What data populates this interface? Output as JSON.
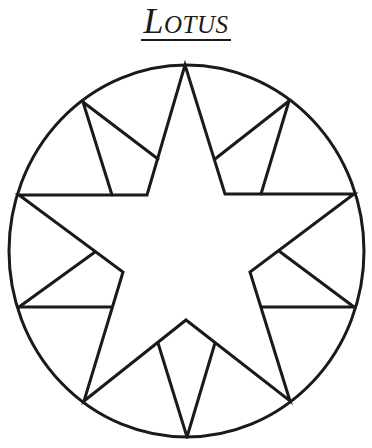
{
  "title": "Lotus",
  "diagram": {
    "type": "quilt-block",
    "stroke_color": "#1a1a1a",
    "background": "#ffffff",
    "circle": {
      "cx": 186.5,
      "cy": 251,
      "rx": 177.5,
      "ry": 186
    },
    "star_outline": [
      [
        185,
        65
      ],
      [
        225,
        194
      ],
      [
        354,
        194
      ],
      [
        250,
        272
      ],
      [
        290,
        401
      ],
      [
        186,
        320
      ],
      [
        84,
        401
      ],
      [
        123,
        272
      ],
      [
        19,
        195
      ],
      [
        147,
        195
      ]
    ],
    "helper_lines": [
      [
        [
          83,
          102
        ],
        [
          158,
          159
        ]
      ],
      [
        [
          83,
          102
        ],
        [
          112,
          195
        ]
      ],
      [
        [
          289,
          101
        ],
        [
          215,
          159
        ]
      ],
      [
        [
          289,
          101
        ],
        [
          261,
          194
        ]
      ],
      [
        [
          279,
          251
        ],
        [
          354,
          307
        ]
      ],
      [
        [
          262,
          307
        ],
        [
          354,
          307
        ]
      ],
      [
        [
          95,
          252
        ],
        [
          19,
          307
        ]
      ],
      [
        [
          19,
          307
        ],
        [
          111,
          307
        ]
      ],
      [
        [
          158,
          343
        ],
        [
          187,
          437
        ]
      ],
      [
        [
          215,
          343
        ],
        [
          187,
          437
        ]
      ]
    ]
  }
}
